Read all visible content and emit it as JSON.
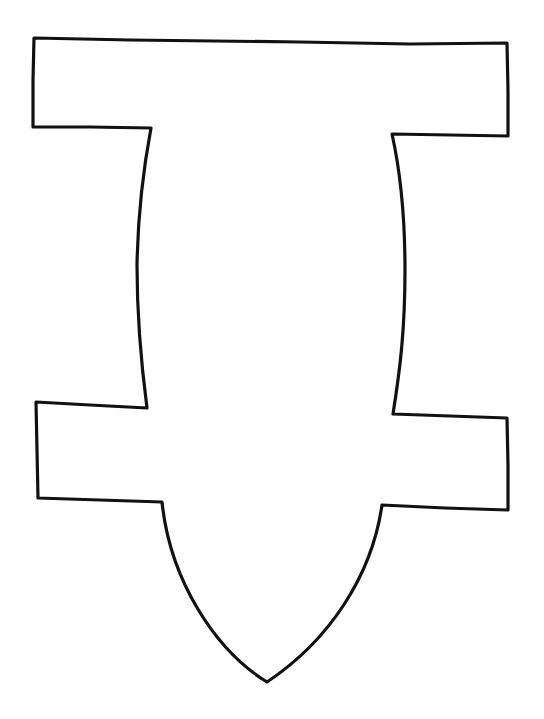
{
  "drawing": {
    "description": "Hand-drawn outline of a symmetric shape with two horizontal bars, a slightly curved central body, and a pointed bottom",
    "stroke_color": "#111111",
    "background_color": "#ffffff",
    "stroke_width": 3.2
  }
}
